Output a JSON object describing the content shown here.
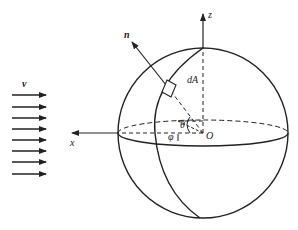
{
  "diagram": {
    "type": "sphere-in-uniform-flow",
    "labels": {
      "velocity": "v",
      "normal": "n",
      "area_element": "dA",
      "z_axis": "z",
      "x_axis": "x",
      "origin": "O",
      "polar_angle": "θ",
      "azimuth_angle": "φ"
    },
    "flow_arrows_count": 8,
    "colors": {
      "stroke": "#222222",
      "background": "#ffffff"
    }
  }
}
